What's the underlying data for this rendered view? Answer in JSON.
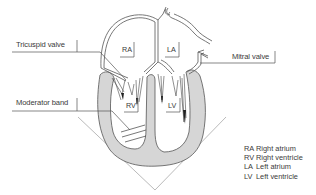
{
  "diagram": {
    "labels": {
      "tricuspid_valve": "Tricuspid valve",
      "mitral_valve": "Mitral valve",
      "moderator_band": "Moderator band"
    },
    "chambers": {
      "ra": "RA",
      "la": "LA",
      "rv": "RV",
      "lv": "LV"
    },
    "legend": [
      {
        "abbr": "RA",
        "meaning": "Right atrium"
      },
      {
        "abbr": "RV",
        "meaning": "Right ventricle"
      },
      {
        "abbr": "LA",
        "meaning": "Left atrium"
      },
      {
        "abbr": "LV",
        "meaning": "Left ventricle"
      }
    ],
    "colors": {
      "outline": "#555555",
      "myocardium": "#d4d4d4",
      "leader_line": "#555555",
      "v_lines": "#9a9a9a",
      "text": "#3a3a3a"
    }
  }
}
